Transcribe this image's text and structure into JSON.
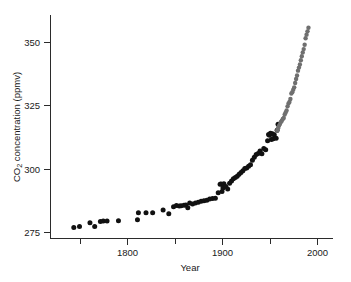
{
  "chart_data": {
    "type": "scatter",
    "title": "",
    "xlabel": "Year",
    "ylabel": "CO2 concentration (ppmv)",
    "ylabel_display": "CO₂ concentration (ppmv)",
    "xlim": [
      1735,
      2000
    ],
    "ylim": [
      273,
      358
    ],
    "grid": false,
    "legend": "none",
    "x_ticks_major": [
      1800,
      1900,
      2000
    ],
    "x_ticks_minor": [
      1750,
      1850,
      1950
    ],
    "x_tick_labels": [
      "1800",
      "1900",
      "2000"
    ],
    "y_ticks": [
      275,
      300,
      325,
      350
    ],
    "y_tick_labels": [
      "275",
      "300",
      "325",
      "350"
    ],
    "colors": {
      "ice_core": "#111111",
      "mauna_loa": "#6f6f6f",
      "axis": "#2b2b2b",
      "background": "#ffffff"
    },
    "series": [
      {
        "name": "ice core",
        "marker": "filled circle",
        "color": "#111111",
        "points": [
          [
            1744,
            276.8
          ],
          [
            1750,
            277.2
          ],
          [
            1761,
            278.7
          ],
          [
            1766,
            277.2
          ],
          [
            1772,
            279.1
          ],
          [
            1775,
            279.3
          ],
          [
            1779,
            279.3
          ],
          [
            1791,
            279.4
          ],
          [
            1811,
            279.8
          ],
          [
            1812,
            282.6
          ],
          [
            1820,
            282.6
          ],
          [
            1827,
            282.6
          ],
          [
            1838,
            283.7
          ],
          [
            1844,
            282.2
          ],
          [
            1849,
            285.0
          ],
          [
            1852,
            285.5
          ],
          [
            1855,
            285.3
          ],
          [
            1857,
            285.4
          ],
          [
            1860,
            285.6
          ],
          [
            1862,
            285.7
          ],
          [
            1864,
            284.6
          ],
          [
            1866,
            286.4
          ],
          [
            1869,
            286.1
          ],
          [
            1872,
            286.4
          ],
          [
            1875,
            286.7
          ],
          [
            1878,
            287.1
          ],
          [
            1881,
            287.3
          ],
          [
            1884,
            287.5
          ],
          [
            1887,
            288.0
          ],
          [
            1890,
            288.2
          ],
          [
            1893,
            288.3
          ],
          [
            1896,
            290.5
          ],
          [
            1898,
            293.8
          ],
          [
            1899,
            293.9
          ],
          [
            1900,
            291.0
          ],
          [
            1901,
            292.4
          ],
          [
            1902,
            294.0
          ],
          [
            1904,
            293.0
          ],
          [
            1906,
            292.0
          ],
          [
            1908,
            294.2
          ],
          [
            1910,
            295.1
          ],
          [
            1912,
            296.0
          ],
          [
            1914,
            296.5
          ],
          [
            1916,
            297.0
          ],
          [
            1918,
            297.8
          ],
          [
            1920,
            298.5
          ],
          [
            1922,
            299.2
          ],
          [
            1924,
            300.1
          ],
          [
            1926,
            300.3
          ],
          [
            1928,
            301.0
          ],
          [
            1930,
            301.5
          ],
          [
            1932,
            303.3
          ],
          [
            1934,
            304.5
          ],
          [
            1936,
            305.6
          ],
          [
            1938,
            306.0
          ],
          [
            1940,
            307.0
          ],
          [
            1942,
            305.9
          ],
          [
            1944,
            308.0
          ],
          [
            1946,
            307.5
          ],
          [
            1948,
            311.0
          ],
          [
            1949,
            313.5
          ],
          [
            1950,
            313.2
          ],
          [
            1951,
            314.0
          ],
          [
            1952,
            311.5
          ],
          [
            1953,
            313.8
          ],
          [
            1954,
            311.8
          ],
          [
            1955,
            313.4
          ],
          [
            1957,
            312.0
          ],
          [
            1958,
            315.2
          ],
          [
            1959,
            317.5
          ]
        ]
      },
      {
        "name": "Mauna Loa",
        "marker": "filled circle",
        "color": "#6f6f6f",
        "points": [
          [
            1958,
            315.0
          ],
          [
            1959,
            316.0
          ],
          [
            1960,
            316.9
          ],
          [
            1961,
            317.6
          ],
          [
            1962,
            318.4
          ],
          [
            1963,
            318.9
          ],
          [
            1964,
            319.6
          ],
          [
            1965,
            320.0
          ],
          [
            1966,
            321.4
          ],
          [
            1967,
            322.2
          ],
          [
            1968,
            323.0
          ],
          [
            1969,
            324.6
          ],
          [
            1970,
            325.7
          ],
          [
            1971,
            326.3
          ],
          [
            1972,
            327.5
          ],
          [
            1973,
            329.7
          ],
          [
            1974,
            330.2
          ],
          [
            1975,
            331.2
          ],
          [
            1976,
            332.1
          ],
          [
            1977,
            333.8
          ],
          [
            1978,
            335.4
          ],
          [
            1979,
            336.8
          ],
          [
            1980,
            338.7
          ],
          [
            1981,
            339.9
          ],
          [
            1982,
            341.1
          ],
          [
            1983,
            342.8
          ],
          [
            1984,
            344.4
          ],
          [
            1985,
            345.9
          ],
          [
            1986,
            347.2
          ],
          [
            1987,
            348.9
          ],
          [
            1988,
            351.5
          ],
          [
            1989,
            352.9
          ],
          [
            1990,
            354.2
          ],
          [
            1991,
            355.6
          ]
        ]
      }
    ]
  }
}
